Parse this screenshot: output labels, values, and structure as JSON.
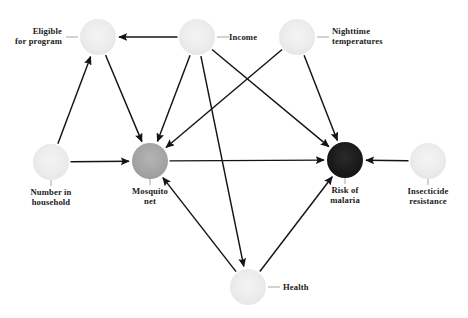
{
  "diagram": {
    "type": "directed-acyclic-graph",
    "canvas": {
      "width": 468,
      "height": 318,
      "background": "#ffffff"
    },
    "node_colors": {
      "unobserved_light": "#ededed",
      "treatment_gray": "#a8a8a8",
      "outcome_black": "#1a1a1a",
      "edge": "#141414",
      "leader": "#9a9a9a",
      "text": "#1a1a1a"
    },
    "nodes": [
      {
        "id": "eligible",
        "label": "Eligible\nfor program",
        "label_line1": "Eligible",
        "label_line2": "for program",
        "cx": 98,
        "cy": 37,
        "r": 18,
        "fill": "#ededed",
        "label_anchor": "left",
        "label_x": 62,
        "label_y": 34,
        "leader": {
          "x1": 78,
          "y1": 37,
          "x2": 66,
          "y2": 37
        }
      },
      {
        "id": "income",
        "label": "Income",
        "label_line1": "Income",
        "label_line2": "",
        "cx": 197,
        "cy": 37,
        "r": 18,
        "fill": "#ededed",
        "label_anchor": "right",
        "label_x": 229,
        "label_y": 40,
        "leader": {
          "x1": 217,
          "y1": 37,
          "x2": 229,
          "y2": 37
        }
      },
      {
        "id": "nighttime",
        "label": "Nighttime\ntemperatures",
        "label_line1": "Nighttime",
        "label_line2": "temperatures",
        "cx": 297,
        "cy": 37,
        "r": 18,
        "fill": "#ededed",
        "label_anchor": "right",
        "label_x": 332,
        "label_y": 34,
        "leader": {
          "x1": 317,
          "y1": 37,
          "x2": 329,
          "y2": 37
        }
      },
      {
        "id": "household",
        "label": "Number in\nhousehold",
        "label_line1": "Number in",
        "label_line2": "household",
        "cx": 51,
        "cy": 162,
        "r": 18,
        "fill": "#ededed",
        "label_anchor": "below",
        "label_x": 51,
        "label_y": 195,
        "leader": {
          "x1": 51,
          "y1": 162,
          "x2": 51,
          "y2": 186
        }
      },
      {
        "id": "net",
        "label": "Mosquito\nnet",
        "label_line1": "Mosquito",
        "label_line2": "net",
        "cx": 150,
        "cy": 161,
        "r": 18,
        "fill": "#a8a8a8",
        "label_anchor": "below",
        "label_x": 150,
        "label_y": 194,
        "leader": {
          "x1": 150,
          "y1": 161,
          "x2": 150,
          "y2": 185
        }
      },
      {
        "id": "malaria",
        "label": "Risk of\nmalaria",
        "label_line1": "Risk of",
        "label_line2": "malaria",
        "cx": 345,
        "cy": 160,
        "r": 18,
        "fill": "#1a1a1a",
        "label_anchor": "below",
        "label_x": 345,
        "label_y": 193,
        "leader": {
          "x1": 345,
          "y1": 160,
          "x2": 345,
          "y2": 184
        }
      },
      {
        "id": "insecticide",
        "label": "Insecticide\nresistance",
        "label_line1": "Insecticide",
        "label_line2": "resistance",
        "cx": 428,
        "cy": 161,
        "r": 18,
        "fill": "#ededed",
        "label_anchor": "below",
        "label_x": 428,
        "label_y": 194,
        "leader": {
          "x1": 428,
          "y1": 161,
          "x2": 428,
          "y2": 185
        }
      },
      {
        "id": "health",
        "label": "Health",
        "label_line1": "Health",
        "label_line2": "",
        "cx": 248,
        "cy": 287,
        "r": 18,
        "fill": "#ededed",
        "label_anchor": "right",
        "label_x": 283,
        "label_y": 290,
        "leader": {
          "x1": 268,
          "y1": 287,
          "x2": 280,
          "y2": 287
        }
      }
    ],
    "edges": [
      {
        "id": "income-eligible",
        "from": "income",
        "to": "eligible",
        "label": "Income to Eligible for program"
      },
      {
        "id": "household-eligible",
        "from": "household",
        "to": "eligible",
        "label": "Number in household to Eligible for program"
      },
      {
        "id": "eligible-net",
        "from": "eligible",
        "to": "net",
        "label": "Eligible for program to Mosquito net"
      },
      {
        "id": "household-net",
        "from": "household",
        "to": "net",
        "label": "Number in household to Mosquito net"
      },
      {
        "id": "income-net",
        "from": "income",
        "to": "net",
        "label": "Income to Mosquito net"
      },
      {
        "id": "nighttime-net",
        "from": "nighttime",
        "to": "net",
        "label": "Nighttime temperatures to Mosquito net"
      },
      {
        "id": "health-net",
        "from": "health",
        "to": "net",
        "label": "Health to Mosquito net"
      },
      {
        "id": "net-malaria",
        "from": "net",
        "to": "malaria",
        "label": "Mosquito net to Risk of malaria"
      },
      {
        "id": "income-malaria",
        "from": "income",
        "to": "malaria",
        "label": "Income to Risk of malaria"
      },
      {
        "id": "nighttime-malaria",
        "from": "nighttime",
        "to": "malaria",
        "label": "Nighttime temperatures to Risk of malaria"
      },
      {
        "id": "insect-malaria",
        "from": "insecticide",
        "to": "malaria",
        "label": "Insecticide resistance to Risk of malaria"
      },
      {
        "id": "health-malaria",
        "from": "health",
        "to": "malaria",
        "label": "Health to Risk of malaria"
      },
      {
        "id": "income-health",
        "from": "income",
        "to": "health",
        "label": "Income to Health"
      }
    ]
  }
}
